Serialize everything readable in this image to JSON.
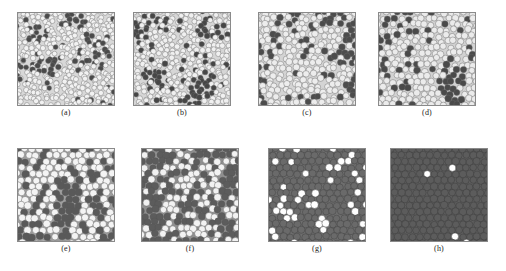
{
  "figure": {
    "type": "multi-panel-scientific-figure",
    "panel_count": 8,
    "rows": 2,
    "columns": 4,
    "background_color": "#ffffff",
    "border_color": "#8a8a8a"
  },
  "panels": [
    {
      "id": "a",
      "label": "(a)",
      "x": 17,
      "y": 12,
      "w": 98,
      "h": 94,
      "label_y": 108,
      "description": "dense disordered packing of small light disks with scattered dark defect clusters",
      "background_color": "#d8d8d8",
      "disk_fill": "#f2f2f2",
      "disk_stroke": "#6f6f6f",
      "dark_fill": "#4a4a4a",
      "disk_radius": 2.6,
      "lattice": "amorphous",
      "jitter": 0.55,
      "dark_fraction": 0.09,
      "dark_cluster_seeds": 7,
      "seed": 101
    },
    {
      "id": "b",
      "label": "(b)",
      "x": 133,
      "y": 12,
      "w": 98,
      "h": 94,
      "label_y": 108,
      "description": "dense packing of small light disks with more numerous dark clusters than panel a",
      "background_color": "#d6d6d6",
      "disk_fill": "#f0f0f0",
      "disk_stroke": "#6b6b6b",
      "dark_fill": "#464646",
      "disk_radius": 2.7,
      "lattice": "amorphous",
      "jitter": 0.48,
      "dark_fraction": 0.12,
      "dark_cluster_seeds": 12,
      "seed": 202
    },
    {
      "id": "c",
      "label": "(c)",
      "x": 258,
      "y": 12,
      "w": 98,
      "h": 94,
      "label_y": 108,
      "description": "partially ordered packing of larger light disks with dark defect clusters",
      "background_color": "#d4d4d4",
      "disk_fill": "#ededed",
      "disk_stroke": "#686868",
      "dark_fill": "#4c4c4c",
      "disk_radius": 3.2,
      "lattice": "hex",
      "jitter": 0.32,
      "dark_fraction": 0.13,
      "dark_cluster_seeds": 10,
      "seed": 303
    },
    {
      "id": "d",
      "label": "(d)",
      "x": 378,
      "y": 12,
      "w": 98,
      "h": 94,
      "label_y": 108,
      "description": "ordered hexagonal packing of light disks with dark defect clusters",
      "background_color": "#d2d2d2",
      "disk_fill": "#ebebeb",
      "disk_stroke": "#656565",
      "dark_fill": "#4a4a4a",
      "disk_radius": 3.3,
      "lattice": "hex",
      "jitter": 0.26,
      "dark_fraction": 0.15,
      "dark_cluster_seeds": 11,
      "seed": 404
    },
    {
      "id": "e",
      "label": "(e)",
      "x": 17,
      "y": 148,
      "w": 98,
      "h": 94,
      "label_y": 244,
      "description": "hexagonal packing of light disks on mid-grey background with dark patches",
      "background_color": "#9e9e9e",
      "disk_fill": "#f4f4f4",
      "disk_stroke": "#5a5a5a",
      "dark_fill": "#595959",
      "disk_radius": 3.6,
      "lattice": "hex",
      "jitter": 0.18,
      "dark_fraction": 0.22,
      "dark_cluster_seeds": 9,
      "seed": 505
    },
    {
      "id": "f",
      "label": "(f)",
      "x": 141,
      "y": 148,
      "w": 98,
      "h": 94,
      "label_y": 244,
      "description": "hexagonal packing with roughly equal light and dark disks forming mottled domains",
      "background_color": "#8f8f8f",
      "disk_fill": "#f2f2f2",
      "disk_stroke": "#545454",
      "dark_fill": "#5c5c5c",
      "disk_radius": 3.5,
      "lattice": "hex",
      "jitter": 0.2,
      "dark_fraction": 0.38,
      "dark_cluster_seeds": 12,
      "seed": 606
    },
    {
      "id": "g",
      "label": "(g)",
      "x": 268,
      "y": 148,
      "w": 98,
      "h": 94,
      "label_y": 244,
      "description": "dark grey lattice with many scattered bright white disks",
      "background_color": "#6e6e6e",
      "disk_fill": "#6a6a6a",
      "disk_stroke": "#3f3f3f",
      "dark_fill": "#ffffff",
      "disk_radius": 3.6,
      "lattice": "hex",
      "jitter": 0.14,
      "dark_fraction": 0.2,
      "dark_cluster_seeds": 0,
      "seed": 707
    },
    {
      "id": "h",
      "label": "(h)",
      "x": 390,
      "y": 148,
      "w": 98,
      "h": 94,
      "label_y": 244,
      "description": "uniform dark hexagonal lattice with only a few isolated bright white disks",
      "background_color": "#5f5f5f",
      "disk_fill": "#5c5c5c",
      "disk_stroke": "#3a3a3a",
      "dark_fill": "#ffffff",
      "disk_radius": 3.6,
      "lattice": "hex",
      "jitter": 0.08,
      "dark_fraction": 0.016,
      "dark_cluster_seeds": 0,
      "seed": 808
    }
  ],
  "chart_data": {
    "type": "scatter",
    "title": "",
    "xlabel": "",
    "ylabel": "",
    "series": [
      {
        "name": "(a)",
        "bright_fraction": 0.91,
        "dark_fraction": 0.09,
        "order": "amorphous",
        "particle_size": "small"
      },
      {
        "name": "(b)",
        "bright_fraction": 0.88,
        "dark_fraction": 0.12,
        "order": "amorphous",
        "particle_size": "small"
      },
      {
        "name": "(c)",
        "bright_fraction": 0.87,
        "dark_fraction": 0.13,
        "order": "partial-hex",
        "particle_size": "medium"
      },
      {
        "name": "(d)",
        "bright_fraction": 0.85,
        "dark_fraction": 0.15,
        "order": "hex",
        "particle_size": "medium"
      },
      {
        "name": "(e)",
        "bright_fraction": 0.78,
        "dark_fraction": 0.22,
        "order": "hex",
        "particle_size": "large"
      },
      {
        "name": "(f)",
        "bright_fraction": 0.62,
        "dark_fraction": 0.38,
        "order": "hex",
        "particle_size": "large"
      },
      {
        "name": "(g)",
        "bright_fraction": 0.2,
        "dark_fraction": 0.8,
        "order": "hex",
        "particle_size": "large"
      },
      {
        "name": "(h)",
        "bright_fraction": 0.016,
        "dark_fraction": 0.984,
        "order": "hex",
        "particle_size": "large"
      }
    ],
    "legend": []
  }
}
